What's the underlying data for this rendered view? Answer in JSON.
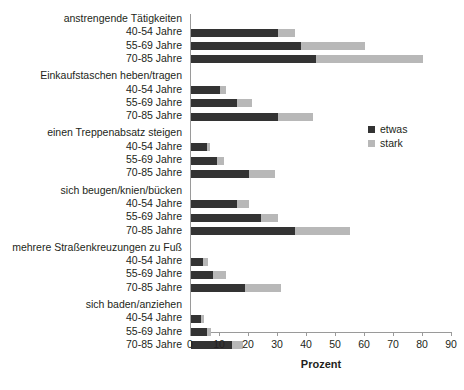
{
  "chart_data": {
    "type": "bar",
    "orientation": "horizontal",
    "stacked": true,
    "title": "",
    "xlabel": "Prozent",
    "ylabel": "",
    "xlim": [
      0,
      90
    ],
    "xticks": [
      0,
      10,
      20,
      30,
      40,
      50,
      60,
      70,
      80,
      90
    ],
    "grid": false,
    "legend_position": "right-middle",
    "series": [
      {
        "name": "etwas",
        "color": "#333333"
      },
      {
        "name": "stark",
        "color": "#b8b8b8"
      }
    ],
    "groups": [
      {
        "label": "anstrengende Tätigkeiten",
        "rows": [
          {
            "label": "40-54 Jahre",
            "etwas": 30,
            "stark": 6
          },
          {
            "label": "55-69 Jahre",
            "etwas": 38,
            "stark": 22
          },
          {
            "label": "70-85 Jahre",
            "etwas": 43,
            "stark": 37
          }
        ]
      },
      {
        "label": "Einkaufstaschen heben/tragen",
        "rows": [
          {
            "label": "40-54 Jahre",
            "etwas": 10,
            "stark": 2
          },
          {
            "label": "55-69 Jahre",
            "etwas": 16,
            "stark": 5
          },
          {
            "label": "70-85 Jahre",
            "etwas": 30,
            "stark": 12
          }
        ]
      },
      {
        "label": "einen Treppenabsatz steigen",
        "rows": [
          {
            "label": "40-54 Jahre",
            "etwas": 5.5,
            "stark": 1
          },
          {
            "label": "55-69 Jahre",
            "etwas": 9,
            "stark": 2.5
          },
          {
            "label": "70-85 Jahre",
            "etwas": 20,
            "stark": 9
          }
        ]
      },
      {
        "label": "sich beugen/knien/bücken",
        "rows": [
          {
            "label": "40-54 Jahre",
            "etwas": 16,
            "stark": 4
          },
          {
            "label": "55-69 Jahre",
            "etwas": 24,
            "stark": 6
          },
          {
            "label": "70-85 Jahre",
            "etwas": 36,
            "stark": 19
          }
        ]
      },
      {
        "label": "mehrere Straßenkreuzungen zu Fuß",
        "rows": [
          {
            "label": "40-54 Jahre",
            "etwas": 4,
            "stark": 2
          },
          {
            "label": "55-69 Jahre",
            "etwas": 7.5,
            "stark": 4.5
          },
          {
            "label": "70-85 Jahre",
            "etwas": 18.5,
            "stark": 12.5
          }
        ]
      },
      {
        "label": "sich baden/anziehen",
        "rows": [
          {
            "label": "40-54 Jahre",
            "etwas": 3.5,
            "stark": 1
          },
          {
            "label": "55-69 Jahre",
            "etwas": 5.5,
            "stark": 1.5
          },
          {
            "label": "70-85 Jahre",
            "etwas": 14,
            "stark": 4
          }
        ]
      }
    ]
  }
}
